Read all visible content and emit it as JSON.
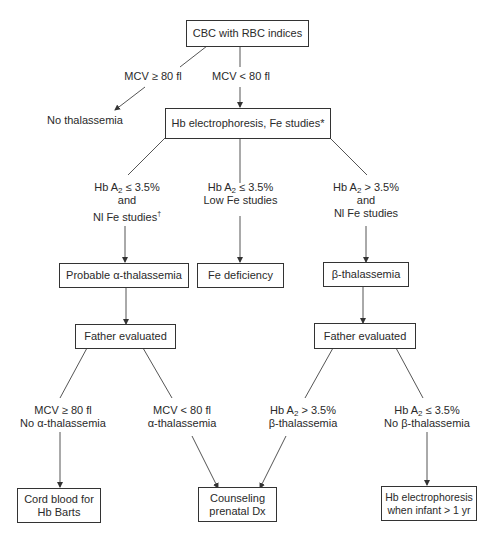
{
  "diagram": {
    "type": "flowchart",
    "nodes": {
      "cbc": "CBC with RBC indices",
      "no_thal": "No thalassemia",
      "hb_electro": "Hb electrophoresis, Fe studies*",
      "prob_alpha": "Probable α-thalassemia",
      "fe_def": "Fe deficiency",
      "beta_thal": "β-thalassemia",
      "father_left": "Father evaluated",
      "father_right": "Father evaluated",
      "cord_blood": [
        "Cord blood for",
        "Hb Barts"
      ],
      "counseling": [
        "Counseling",
        "prenatal Dx"
      ],
      "hb_infant": [
        "Hb electrophoresis",
        "when infant > 1 yr"
      ]
    },
    "edge_labels": {
      "mcv_ge": "MCV ≥ 80 fl",
      "mcv_lt": "MCV < 80 fl",
      "left_branch": {
        "l1_pre": "Hb A",
        "l1_sub": "2",
        "l1_post": " ≤ 3.5%",
        "l2": "and",
        "l3": "Nl Fe studies",
        "l3_sup": "†"
      },
      "mid_branch": {
        "l1_pre": "Hb A",
        "l1_sub": "2",
        "l1_post": " ≤ 3.5%",
        "l2": "Low Fe studies"
      },
      "right_branch": {
        "l1_pre": "Hb A",
        "l1_sub": "2",
        "l1_post": " > 3.5%",
        "l2": "and",
        "l3": "Nl Fe studies"
      },
      "father_l_left": {
        "l1": "MCV ≥ 80 fl",
        "l2": "No α-thalassemia"
      },
      "father_l_right": {
        "l1": "MCV < 80 fl",
        "l2": "α-thalassemia"
      },
      "father_r_left": {
        "l1_pre": "Hb A",
        "l1_sub": "2",
        "l1_post": " > 3.5%",
        "l2": "β-thalassemia"
      },
      "father_r_right": {
        "l1_pre": "Hb A",
        "l1_sub": "2",
        "l1_post": " ≤ 3.5%",
        "l2": "No β-thalassemia"
      }
    },
    "colors": {
      "line": "#555555",
      "border": "#333333",
      "text": "#2a2a2a"
    }
  }
}
